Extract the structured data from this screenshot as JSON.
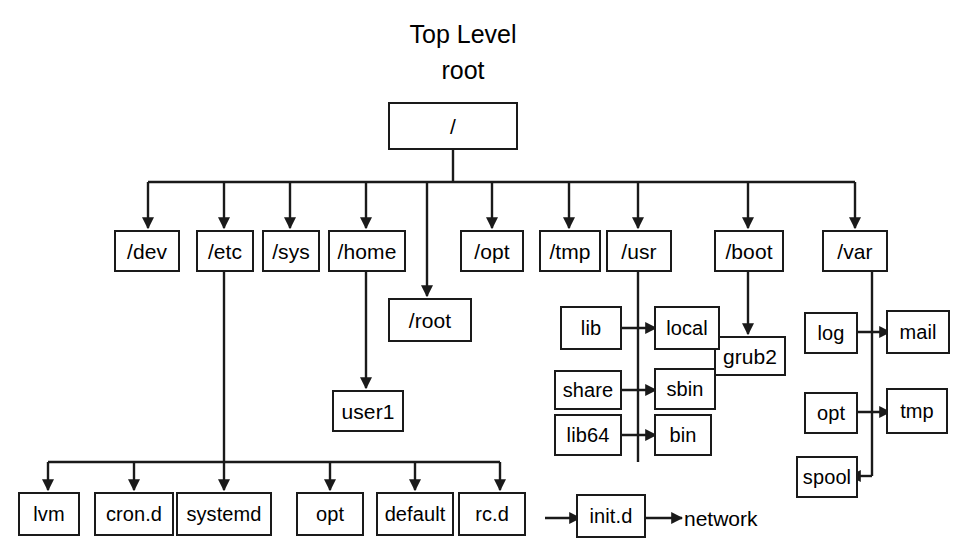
{
  "diagram": {
    "title_line1": "Top Level",
    "title_line2": "root",
    "root": {
      "label": "/"
    },
    "level1": [
      {
        "label": "/dev"
      },
      {
        "label": "/etc"
      },
      {
        "label": "/sys"
      },
      {
        "label": "/home"
      },
      {
        "label": "/opt"
      },
      {
        "label": "/tmp"
      },
      {
        "label": "/usr"
      },
      {
        "label": "/boot"
      },
      {
        "label": "/var"
      }
    ],
    "root_home_child": {
      "label": "/root"
    },
    "home_child": {
      "label": "user1"
    },
    "boot_child": {
      "label": "grub2"
    },
    "usr_children": [
      {
        "left": "lib",
        "right": "local"
      },
      {
        "left": "share",
        "right": "sbin"
      },
      {
        "left": "lib64",
        "right": "bin"
      }
    ],
    "var_children": [
      {
        "left": "log",
        "right": "mail"
      },
      {
        "left": "opt",
        "right": "tmp"
      },
      {
        "left": "spool",
        "right": null
      }
    ],
    "etc_children": [
      {
        "label": "lvm"
      },
      {
        "label": "cron.d"
      },
      {
        "label": "systemd"
      },
      {
        "label": "opt"
      },
      {
        "label": "default"
      },
      {
        "label": "rc.d"
      }
    ],
    "rcd_child": {
      "label": "init.d"
    },
    "initd_child": {
      "label": "network"
    },
    "colors": {
      "line": "#1a1a1a",
      "box_border": "#1a1a1a",
      "background": "#ffffff",
      "text": "#000000"
    }
  }
}
